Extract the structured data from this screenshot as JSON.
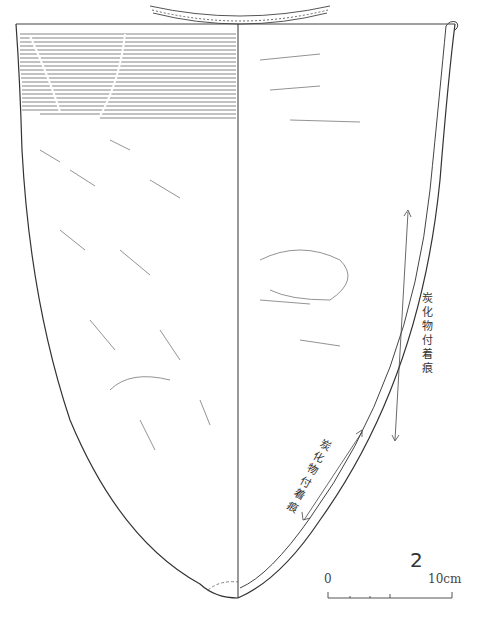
{
  "figure": {
    "number": "2",
    "annotations": [
      {
        "text": "炭化物付着痕",
        "position": "right-upper"
      },
      {
        "text": "炭化物付着痕",
        "position": "right-lower"
      }
    ],
    "scale_bar": {
      "start_label": "0",
      "end_label": "10cm"
    }
  }
}
